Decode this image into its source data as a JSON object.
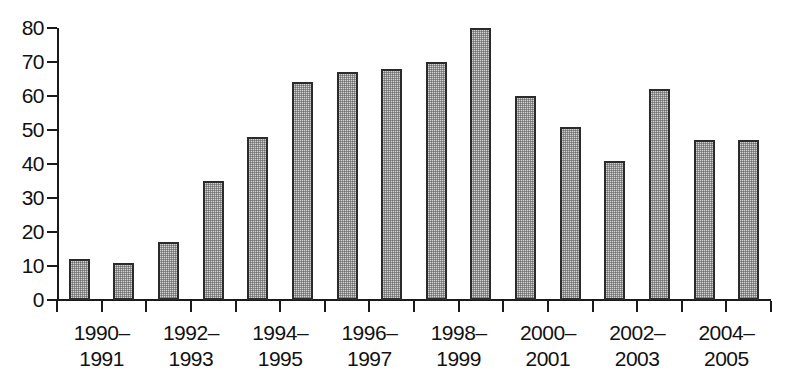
{
  "chart_data": {
    "type": "bar",
    "title": "",
    "subtitle": "",
    "xlabel": "",
    "ylabel": "",
    "ylim": [
      0,
      80
    ],
    "y_ticks": [
      0,
      10,
      20,
      30,
      40,
      50,
      60,
      70,
      80
    ],
    "grid": false,
    "legend": null,
    "categories": [
      "1990",
      "1991",
      "1992",
      "1993",
      "1994",
      "1995",
      "1996",
      "1997",
      "1998",
      "1999",
      "2000",
      "2001",
      "2002",
      "2003",
      "2004",
      "2005"
    ],
    "values": [
      12,
      11,
      17,
      35,
      48,
      64,
      67,
      68,
      70,
      80,
      60,
      51,
      41,
      62,
      47,
      47
    ],
    "group_labels": [
      "1990–\n1991",
      "1992–\n1993",
      "1994–\n1995",
      "1996–\n1997",
      "1998–\n1999",
      "2000–\n2001",
      "2002–\n2003",
      "2004–\n2005"
    ],
    "bar_style": {
      "fill": "#d2d2d2",
      "pattern": "stipple",
      "border": "#2b2b2b"
    },
    "axis_color": "#1a1a1a"
  }
}
